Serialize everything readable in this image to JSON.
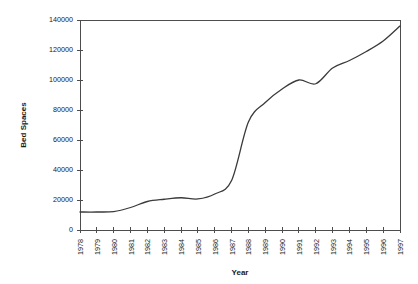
{
  "chart_data": {
    "type": "line",
    "title": "",
    "xlabel": "Year",
    "ylabel": "Bed Spaces",
    "xlim": [
      1978,
      1997
    ],
    "ylim": [
      0,
      140000
    ],
    "grid": false,
    "legend": null,
    "y_ticks": [
      0,
      20000,
      40000,
      60000,
      80000,
      100000,
      120000,
      140000
    ],
    "y_tick_labels": [
      "0",
      "20000",
      "40000",
      "60000",
      "80000",
      "100000",
      "120000",
      "140000"
    ],
    "x_ticks": [
      1978,
      1979,
      1980,
      1981,
      1982,
      1983,
      1984,
      1985,
      1986,
      1987,
      1988,
      1989,
      1990,
      1991,
      1992,
      1993,
      1994,
      1995,
      1996,
      1997
    ],
    "x_tick_labels": [
      "1978",
      "1979",
      "1980",
      "1981",
      "1982",
      "1983",
      "1984",
      "1985",
      "1986",
      "1987",
      "1988",
      "1989",
      "1990",
      "1991",
      "1992",
      "1993",
      "1994",
      "1995",
      "1996",
      "1997"
    ],
    "categories": [
      "1978",
      "1979",
      "1980",
      "1981",
      "1982",
      "1983",
      "1984",
      "1985",
      "1986",
      "1987",
      "1988",
      "1989",
      "1990",
      "1991",
      "1992",
      "1993",
      "1994",
      "1995",
      "1996",
      "1997"
    ],
    "values": [
      12000,
      12000,
      12300,
      15000,
      19000,
      20500,
      21500,
      20700,
      24000,
      33000,
      72000,
      85000,
      94000,
      100000,
      97500,
      108000,
      113000,
      119000,
      126000,
      136000
    ],
    "series": [
      {
        "name": "Bed Spaces",
        "color": "#3a3a3a",
        "values": [
          12000,
          12000,
          12300,
          15000,
          19000,
          20500,
          21500,
          20700,
          24000,
          33000,
          72000,
          85000,
          94000,
          100000,
          97500,
          108000,
          113000,
          119000,
          126000,
          136000
        ]
      }
    ]
  },
  "axes": {
    "y_title": "Bed Spaces",
    "x_title": "Year"
  },
  "colors": {
    "line": "#3a3a3a",
    "frame": "#4d4d4d",
    "background": "#ffffff",
    "text": "#1a1a1a"
  }
}
